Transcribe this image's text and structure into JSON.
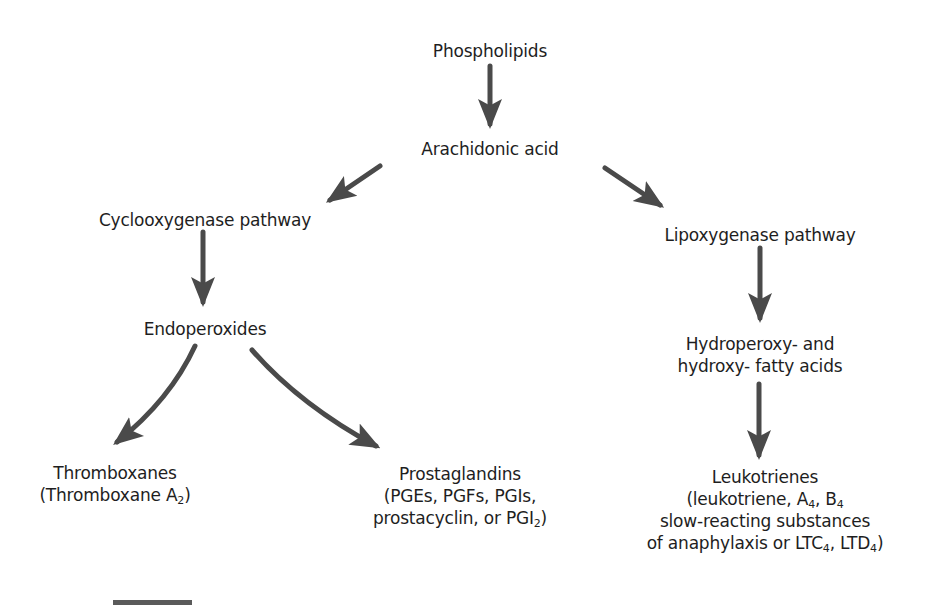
{
  "diagram": {
    "type": "flowchart",
    "arrow_color": "#4a4a4a",
    "nodes": {
      "phospholipids": {
        "label": "Phospholipids"
      },
      "arachidonic_acid": {
        "label": "Arachidonic acid"
      },
      "cyclooxygenase": {
        "label": "Cyclooxygenase pathway"
      },
      "lipoxygenase": {
        "label": "Lipoxygenase pathway"
      },
      "endoperoxides": {
        "label": "Endoperoxides"
      },
      "hydroperoxy": {
        "line1": "Hydroperoxy- and",
        "line2": "hydroxy- fatty acids"
      },
      "thromboxanes": {
        "line1": "Thromboxanes",
        "line2_prefix": "(Thromboxane A",
        "line2_sub": "2",
        "line2_suffix": ")"
      },
      "prostaglandins": {
        "line1": "Prostaglandins",
        "line2": "(PGEs, PGFs, PGIs,",
        "line3_prefix": "prostacyclin, or PGI",
        "line3_sub": "2",
        "line3_suffix": ")"
      },
      "leukotrienes": {
        "line1": "Leukotrienes",
        "line2_a": "(leukotriene, A",
        "line2_sub1": "4",
        "line2_b": ", B",
        "line2_sub2": "4",
        "line3": "slow-reacting substances",
        "line4_a": "of anaphylaxis or LTC",
        "line4_sub1": "4",
        "line4_b": ", LTD",
        "line4_sub2": "4",
        "line4_c": ")"
      }
    },
    "edges": [
      {
        "from": "Phospholipids",
        "to": "Arachidonic acid"
      },
      {
        "from": "Arachidonic acid",
        "to": "Cyclooxygenase pathway"
      },
      {
        "from": "Arachidonic acid",
        "to": "Lipoxygenase pathway"
      },
      {
        "from": "Cyclooxygenase pathway",
        "to": "Endoperoxides"
      },
      {
        "from": "Endoperoxides",
        "to": "Thromboxanes"
      },
      {
        "from": "Endoperoxides",
        "to": "Prostaglandins"
      },
      {
        "from": "Lipoxygenase pathway",
        "to": "Hydroperoxy- and hydroxy- fatty acids"
      },
      {
        "from": "Hydroperoxy- and hydroxy- fatty acids",
        "to": "Leukotrienes"
      }
    ]
  }
}
